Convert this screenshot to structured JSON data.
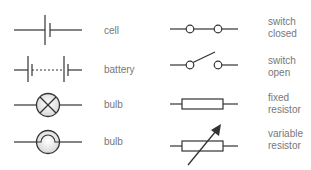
{
  "colors": {
    "line": "#333333",
    "label": "#777777",
    "bulb_fill": "#e8e8e8"
  },
  "symbols": [
    {
      "id": "cell",
      "label": "cell",
      "icon": "cell-icon"
    },
    {
      "id": "battery",
      "label": "battery",
      "icon": "battery-icon"
    },
    {
      "id": "bulb-cross",
      "label": "bulb",
      "icon": "bulb-cross-icon"
    },
    {
      "id": "bulb-filament",
      "label": "bulb",
      "icon": "bulb-filament-icon"
    },
    {
      "id": "switch-closed",
      "label_line1": "switch",
      "label_line2": "closed",
      "icon": "switch-closed-icon"
    },
    {
      "id": "switch-open",
      "label_line1": "switch",
      "label_line2": "open",
      "icon": "switch-open-icon"
    },
    {
      "id": "fixed-resistor",
      "label_line1": "fixed",
      "label_line2": "resistor",
      "icon": "fixed-resistor-icon"
    },
    {
      "id": "variable-resistor",
      "label_line1": "variable",
      "label_line2": "resistor",
      "icon": "variable-resistor-icon"
    }
  ]
}
